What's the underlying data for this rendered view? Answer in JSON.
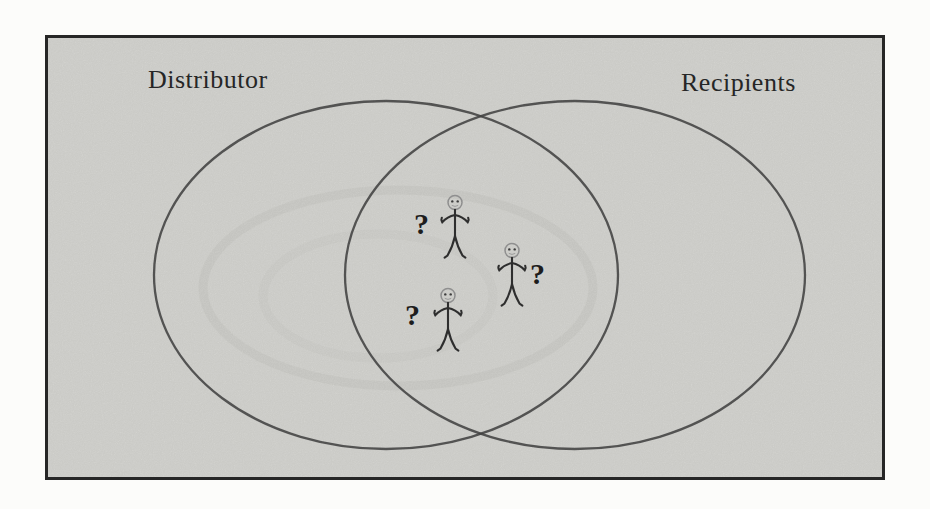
{
  "colors": {
    "page_bg": "#fcfcfa",
    "panel_bg": "#d8d8d4",
    "panel_border": "#262626",
    "ellipse_stroke": "#454545",
    "text": "#262626",
    "question": "#1d1d1d",
    "figure_limbs": "#2e2e2e",
    "figure_head": "#8f8f8f"
  },
  "venn": {
    "left_label": "Distributor",
    "right_label": "Recipients"
  },
  "intersection": {
    "question_mark": "?",
    "figures": [
      {
        "id": "person-1",
        "question_side": "left"
      },
      {
        "id": "person-2",
        "question_side": "right"
      },
      {
        "id": "person-3",
        "question_side": "left"
      }
    ]
  }
}
